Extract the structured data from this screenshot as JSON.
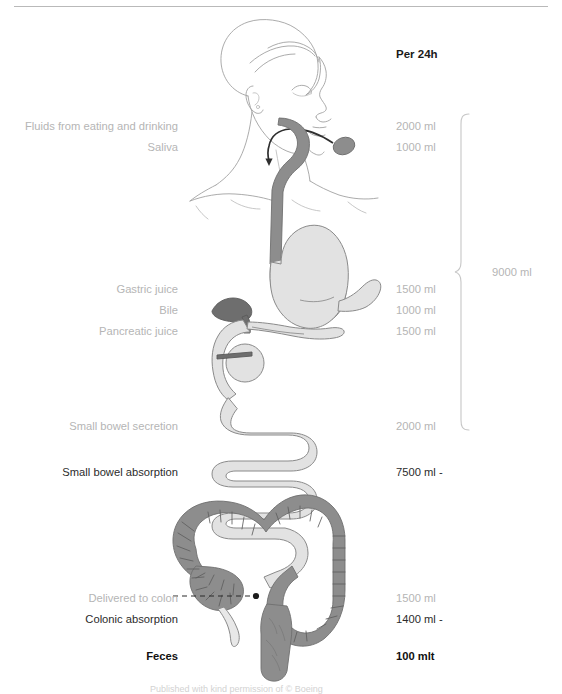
{
  "figure": {
    "title_right": "Per 24h",
    "total_value": "9000 ml",
    "caption": "Published with kind permission of © Boeing",
    "colors": {
      "organ_light": "#e2e2e2",
      "organ_mid": "#8d8d8d",
      "organ_dark": "#6e6e6e",
      "outline": "#8a8a8a",
      "body_outline": "#9a9a9a",
      "text_muted": "#b5b5b5",
      "text_dark": "#2b2b2b",
      "rule": "#b9b9b9"
    }
  },
  "rows": [
    {
      "label": "Fluids from eating and drinking",
      "value": "2000 ml",
      "label_style": "muted",
      "value_style": "muted",
      "y": 120
    },
    {
      "label": "Saliva",
      "value": "1000 ml",
      "label_style": "muted",
      "value_style": "muted",
      "y": 141
    },
    {
      "label": "Gastric juice",
      "value": "1500 ml",
      "label_style": "muted",
      "value_style": "muted",
      "y": 283
    },
    {
      "label": "Bile",
      "value": "1000 ml",
      "label_style": "muted",
      "value_style": "muted",
      "y": 304
    },
    {
      "label": "Pancreatic juice",
      "value": "1500 ml",
      "label_style": "muted",
      "value_style": "muted",
      "y": 325
    },
    {
      "label": "Small bowel secretion",
      "value": "2000 ml",
      "label_style": "muted",
      "value_style": "muted",
      "y": 420
    },
    {
      "label": "Small bowel absorption",
      "value": "7500 ml -",
      "label_style": "dark",
      "value_style": "dark",
      "y": 466
    },
    {
      "label": "Delivered to colon",
      "value": "1500 ml",
      "label_style": "muted",
      "value_style": "muted",
      "y": 592
    },
    {
      "label": "Colonic absorption",
      "value": "1400 ml -",
      "label_style": "dark",
      "value_style": "dark",
      "y": 613
    },
    {
      "label": "Feces",
      "value": "100 mlt",
      "label_style": "bold",
      "value_style": "bold",
      "y": 650
    }
  ],
  "annotations": {
    "brace_label": "9000 ml",
    "leader_line": "delivered-to-colon-dashed-leader"
  }
}
